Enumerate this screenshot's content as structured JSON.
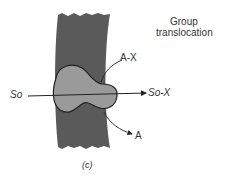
{
  "title": {
    "line1": "Group",
    "line2": "translocation"
  },
  "labels": {
    "substrate_out": "So",
    "substrate_phosphorylated": "So-X",
    "donor": "A-X",
    "product": "A",
    "panel": "(c)"
  },
  "colors": {
    "membrane": "#5a5a5a",
    "protein": "#9a9a9a",
    "line": "#222222"
  }
}
